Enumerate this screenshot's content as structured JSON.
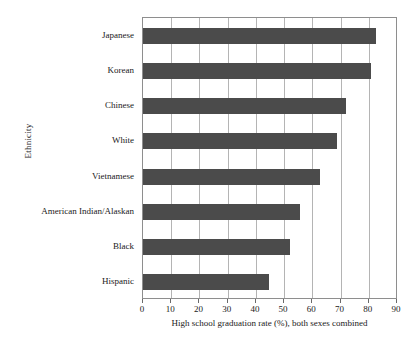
{
  "chart_data": {
    "type": "bar",
    "orientation": "horizontal",
    "title": "",
    "xlabel": "High school graduation rate (%), both sexes combined",
    "ylabel": "Ethnicity",
    "categories": [
      "Japanese",
      "Korean",
      "Chinese",
      "White",
      "Vietnamese",
      "American Indian/Alaskan",
      "Black",
      "Hispanic"
    ],
    "values": [
      82.7,
      80.8,
      72.1,
      68.6,
      62.6,
      55.6,
      52.0,
      44.6
    ],
    "xlim": [
      0,
      90
    ],
    "xticks": [
      0,
      10,
      20,
      30,
      40,
      50,
      60,
      70,
      80,
      90
    ],
    "xtick_labels": [
      "0",
      "10",
      "20",
      "30",
      "40",
      "50",
      "60",
      "70",
      "80",
      "90"
    ],
    "grid": "vertical",
    "legend": "none",
    "bar_color": "#4b4b4b",
    "frame_color": "#8e8e8e",
    "gridline_color": "#b4b4b4",
    "background_color": "#ffffff"
  }
}
